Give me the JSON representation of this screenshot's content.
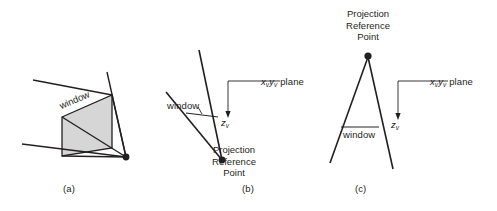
{
  "figure": {
    "background_color": "#ffffff",
    "ink_color": "#231f20",
    "window_fill_color": "#d6d6d6"
  },
  "panels": [
    {
      "id": "a",
      "caption": "(a)",
      "caption_x": 65,
      "caption_y": 186,
      "window_label": "window",
      "window_label_x": 62,
      "window_label_y": 106,
      "has_prp_dot": true,
      "prp_label": null
    },
    {
      "id": "b",
      "caption": "(b)",
      "caption_x": 243,
      "caption_y": 186,
      "window_label": "window",
      "window_label_x": 170,
      "window_label_y": 105,
      "has_prp_dot": true,
      "prp_label": "Projection\nReference\nPoint",
      "prp_label_lines": [
        "Projection",
        "Reference",
        "Point"
      ],
      "prp_label_x": 232,
      "prp_label_y": 148
    },
    {
      "id": "c",
      "caption": "(c)",
      "caption_x": 356,
      "caption_y": 186,
      "window_label": "window",
      "window_label_x": 342,
      "window_label_y": 134,
      "has_prp_dot": true,
      "prp_label": "Projection\nReference\nPoint",
      "prp_label_lines": [
        "Projection",
        "Reference",
        "Point"
      ],
      "prp_label_x": 342,
      "prp_label_y": 8
    }
  ],
  "axes": [
    {
      "panel": "b",
      "plane_label_main": "x",
      "plane_label_sub1": "v",
      "plane_label_main2": "y",
      "plane_label_sub2": "v",
      "plane_label_suffix": " plane",
      "plane_label_x": 261,
      "plane_label_y": 82,
      "depth_axis_main": "z",
      "depth_axis_sub": "v",
      "depth_axis_x": 224,
      "depth_axis_y": 116
    },
    {
      "panel": "c",
      "plane_label_main": "x",
      "plane_label_sub1": "v",
      "plane_label_main2": "y",
      "plane_label_sub2": "v",
      "plane_label_suffix": " plane",
      "plane_label_x": 430,
      "plane_label_y": 82,
      "depth_axis_main": "z",
      "depth_axis_sub": "v",
      "depth_axis_x": 394,
      "depth_axis_y": 118
    }
  ],
  "labels": {
    "window": "window",
    "projection": "Projection",
    "reference": "Reference",
    "point": "Point",
    "caption_a": "(a)",
    "caption_b": "(b)",
    "caption_c": "(c)",
    "plane_suffix": " plane",
    "x_letter": "x",
    "y_letter": "y",
    "z_letter": "z",
    "v_sub": "v"
  }
}
